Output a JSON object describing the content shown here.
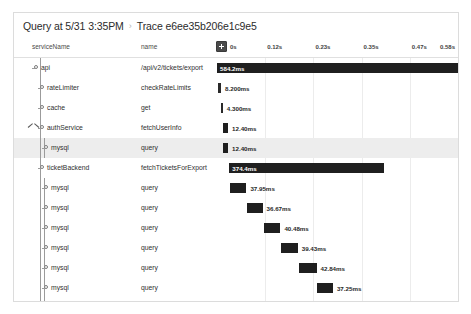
{
  "header": {
    "query_label": "Query at 5/31 3:35PM",
    "separator": "›",
    "trace_label": "Trace e6ee35b206e1c9e5"
  },
  "columns": {
    "service_header": "serviceName",
    "name_header": "name"
  },
  "toolbar": {
    "collapse_all_icon": "plus-square-icon"
  },
  "timeline": {
    "ticks": [
      {
        "label": "0s",
        "pct": 0
      },
      {
        "label": "0.12s",
        "pct": 20
      },
      {
        "label": "0.23s",
        "pct": 40
      },
      {
        "label": "0.35s",
        "pct": 60
      },
      {
        "label": "0.47s",
        "pct": 80
      },
      {
        "label": "0.58s",
        "pct": 100
      }
    ],
    "total_duration_label": "0.58s"
  },
  "chart_data": {
    "type": "bar",
    "title": "Trace e6ee35b206e1c9e5",
    "xlabel": "time",
    "ylabel": "span",
    "xlim": [
      0,
      0.58
    ],
    "grid": true,
    "categories": [
      "api /api/v2/tickets/export",
      "rateLimiter checkRateLimits",
      "cache get",
      "authService fetchUserInfo",
      "mysql query",
      "ticketBackend fetchTicketsForExport",
      "mysql query",
      "mysql query",
      "mysql query",
      "mysql query",
      "mysql query",
      "mysql query",
      "mysql query",
      "mysql query",
      "mysql query",
      "fraud checkFraud"
    ],
    "values": [
      584.2,
      8.2,
      4.3,
      12.4,
      12.4,
      374.4,
      37.95,
      36.67,
      40.48,
      39.43,
      42.84,
      37.25,
      35.92,
      40.0,
      39.83,
      5.103
    ],
    "value_unit": "ms"
  },
  "rows": [
    {
      "service": "api",
      "name": "/api/v2/tickets/export",
      "duration": "584.2ms",
      "depth": 0,
      "start_pct": 0.0,
      "width_pct": 100.0,
      "label_inside": true,
      "has_chevron": false,
      "selected": false
    },
    {
      "service": "rateLimiter",
      "name": "checkRateLimits",
      "duration": "8.200ms",
      "depth": 1,
      "start_pct": 0.3,
      "width_pct": 1.4,
      "label_inside": false,
      "has_chevron": false,
      "selected": false
    },
    {
      "service": "cache",
      "name": "get",
      "duration": "4.300ms",
      "depth": 1,
      "start_pct": 1.6,
      "width_pct": 0.75,
      "label_inside": false,
      "has_chevron": false,
      "selected": false
    },
    {
      "service": "authService",
      "name": "fetchUserInfo",
      "duration": "12.40ms",
      "depth": 1,
      "start_pct": 2.4,
      "width_pct": 2.2,
      "label_inside": false,
      "has_chevron": true,
      "selected": false
    },
    {
      "service": "mysql",
      "name": "query",
      "duration": "12.40ms",
      "depth": 2,
      "start_pct": 2.4,
      "width_pct": 2.2,
      "label_inside": false,
      "has_chevron": false,
      "selected": true
    },
    {
      "service": "ticketBackend",
      "name": "fetchTicketsForExport",
      "duration": "374.4ms",
      "depth": 1,
      "start_pct": 5.1,
      "width_pct": 64.0,
      "label_inside": true,
      "has_chevron": false,
      "selected": false
    },
    {
      "service": "mysql",
      "name": "query",
      "duration": "37.95ms",
      "depth": 2,
      "start_pct": 5.6,
      "width_pct": 6.6,
      "label_inside": false,
      "has_chevron": false,
      "selected": false
    },
    {
      "service": "mysql",
      "name": "query",
      "duration": "36.67ms",
      "depth": 2,
      "start_pct": 12.6,
      "width_pct": 6.3,
      "label_inside": false,
      "has_chevron": false,
      "selected": false
    },
    {
      "service": "mysql",
      "name": "query",
      "duration": "40.48ms",
      "depth": 2,
      "start_pct": 19.3,
      "width_pct": 7.0,
      "label_inside": false,
      "has_chevron": false,
      "selected": false
    },
    {
      "service": "mysql",
      "name": "query",
      "duration": "39.43ms",
      "depth": 2,
      "start_pct": 26.7,
      "width_pct": 6.8,
      "label_inside": false,
      "has_chevron": false,
      "selected": false
    },
    {
      "service": "mysql",
      "name": "query",
      "duration": "42.84ms",
      "depth": 2,
      "start_pct": 33.9,
      "width_pct": 7.4,
      "label_inside": false,
      "has_chevron": false,
      "selected": false
    },
    {
      "service": "mysql",
      "name": "query",
      "duration": "37.25ms",
      "depth": 2,
      "start_pct": 41.7,
      "width_pct": 6.4,
      "label_inside": false,
      "has_chevron": false,
      "selected": false
    },
    {
      "service": "mysql",
      "name": "query",
      "duration": "35.92ms",
      "depth": 2,
      "start_pct": 48.5,
      "width_pct": 6.2,
      "label_inside": false,
      "has_chevron": false,
      "selected": false
    },
    {
      "service": "mysql",
      "name": "query",
      "duration": "40.00ms",
      "depth": 2,
      "start_pct": 55.1,
      "width_pct": 6.9,
      "label_inside": false,
      "has_chevron": false,
      "selected": false
    },
    {
      "service": "mysql",
      "name": "query",
      "duration": "39.83ms",
      "depth": 2,
      "start_pct": 62.4,
      "width_pct": 6.8,
      "label_inside": false,
      "label_left": true,
      "has_chevron": false,
      "selected": false
    },
    {
      "service": "fraud",
      "name": "checkFraud",
      "duration": "5.103ms",
      "depth": 1,
      "start_pct": 87.0,
      "width_pct": 13.0,
      "label_inside": true,
      "has_chevron": false,
      "selected": false
    }
  ]
}
